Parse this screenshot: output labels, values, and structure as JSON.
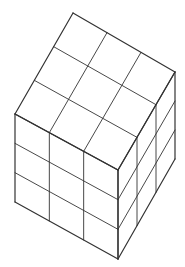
{
  "diagram": {
    "grid_size": 3,
    "stroke_color": "#333333",
    "background": "#ffffff",
    "vertices": {
      "top": [
        73,
        13
      ],
      "right_top": [
        175,
        72
      ],
      "left_top": [
        15,
        114
      ],
      "front_top": [
        118,
        170
      ],
      "left_bottom": [
        15,
        202
      ],
      "right_bottom": [
        175,
        159
      ],
      "front_bottom": [
        118,
        259
      ]
    },
    "faces": [
      "top",
      "left",
      "right"
    ]
  }
}
